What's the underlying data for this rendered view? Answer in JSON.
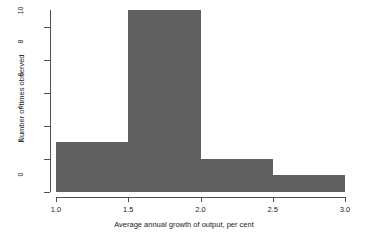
{
  "chart_data": {
    "type": "bar",
    "subtype": "histogram",
    "title": "",
    "xlabel": "Average annual growth of output, per cent",
    "ylabel": "Number of times observed",
    "categories": [
      "1.0-1.5",
      "1.5-2.0",
      "2.0-2.5",
      "2.5-3.0"
    ],
    "bin_edges": [
      1.0,
      1.5,
      2.0,
      2.5,
      3.0
    ],
    "values": [
      3,
      11,
      2,
      1
    ],
    "bars": [
      {
        "bin_start": 1.0,
        "bin_end": 1.5,
        "value": 3
      },
      {
        "bin_start": 1.5,
        "bin_end": 2.0,
        "value": 11
      },
      {
        "bin_start": 2.0,
        "bin_end": 2.5,
        "value": 2
      },
      {
        "bin_start": 2.5,
        "bin_end": 3.0,
        "value": 1
      }
    ],
    "xlim": [
      1.0,
      3.0
    ],
    "ylim": [
      0,
      11
    ],
    "xticks": [
      1.0,
      1.5,
      2.0,
      2.5,
      3.0
    ],
    "xtick_labels": [
      "1.0",
      "1.5",
      "2.0",
      "2.5",
      "3.0"
    ],
    "yticks": [
      0,
      2,
      4,
      6,
      8,
      10
    ],
    "ytick_labels": [
      "0",
      "2",
      "4",
      "6",
      "8",
      "10"
    ],
    "grid": false,
    "legend": false,
    "bar_color": "#616161",
    "axis_color": "#4d4d4d",
    "background_color": "#ffffff"
  }
}
